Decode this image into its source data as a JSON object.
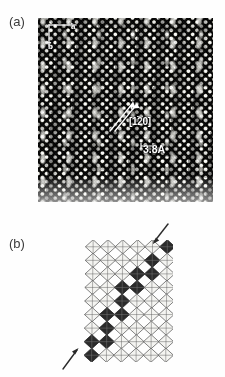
{
  "figure": {
    "panels": [
      {
        "id": "a",
        "label": "(a)",
        "type": "hrtem-micrograph",
        "annotations": {
          "axis_a": "a",
          "axis_b": "b",
          "direction_prefix": "[1",
          "direction_bar_digit": "2",
          "direction_suffix": "0]",
          "direction_full": "[1-20]",
          "spacing": "3.8A"
        }
      },
      {
        "id": "b",
        "label": "(b)",
        "type": "structure-model",
        "annotations": {
          "arrow_top": "arrow-pointing-to-dark-octahedron",
          "arrow_bottom": "arrow-pointing-to-dark-octahedron"
        }
      }
    ]
  },
  "colors": {
    "page_background": "#fefefe",
    "micrograph_dark": "#101010",
    "micrograph_bright": "#f2f2ee",
    "annotation_text": "#ffffff",
    "panel_label": "#3b3b3b",
    "model_line": "#5a5a5a",
    "model_shaded": "#2b2b2b",
    "arrow": "#2a2a2a"
  },
  "chart_data": {
    "type": "image",
    "title": "",
    "panel_a": {
      "description": "High-resolution transmission electron micrograph of a lattice viewed along a zone axis, showing a square array of bright spots with diagonal chains of elongated bright contrast.",
      "lattice_spacing_label": "3.8A",
      "lattice_spacing_value": 3.8,
      "lattice_spacing_unit": "A",
      "direction_label": "[1-20]",
      "axes": [
        "a",
        "b"
      ]
    },
    "panel_b": {
      "description": "Schematic structural model: tiling of corner-sharing octahedra drawn as cross-hatched squares, with dark-shaded octahedra forming diagonal chains; arrows mark two of the shaded chains.",
      "grid_columns": 6,
      "grid_rows": 9,
      "shaded_cells": [
        [
          5,
          0
        ],
        [
          4,
          1
        ],
        [
          3,
          2
        ],
        [
          4,
          2
        ],
        [
          3,
          3
        ],
        [
          2,
          3
        ],
        [
          2,
          4
        ],
        [
          1,
          5
        ],
        [
          2,
          5
        ],
        [
          1,
          6
        ],
        [
          0,
          7
        ],
        [
          1,
          7
        ],
        [
          0,
          8
        ]
      ],
      "arrow_count": 2
    }
  }
}
